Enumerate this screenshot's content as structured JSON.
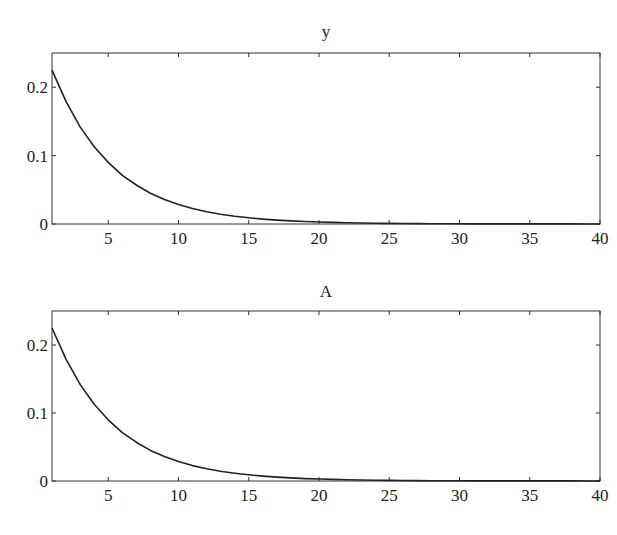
{
  "chart_data": [
    {
      "type": "line",
      "title": "y",
      "xlabel": "",
      "ylabel": "",
      "xlim": [
        1,
        40
      ],
      "ylim": [
        0,
        0.25
      ],
      "xticks": [
        5,
        10,
        15,
        20,
        25,
        30,
        35,
        40
      ],
      "yticks": [
        0,
        0.1,
        0.2
      ],
      "ytick_labels": [
        "0",
        "0.1",
        "0.2"
      ],
      "grid": false,
      "series": [
        {
          "name": "y",
          "x": [
            1,
            2,
            3,
            4,
            5,
            6,
            7,
            8,
            9,
            10,
            11,
            12,
            13,
            14,
            15,
            16,
            17,
            18,
            19,
            20,
            21,
            22,
            23,
            24,
            25,
            26,
            27,
            28,
            29,
            30,
            31,
            32,
            33,
            34,
            35,
            36,
            37,
            38,
            39,
            40
          ],
          "values": [
            0.225,
            0.179,
            0.142,
            0.113,
            0.09,
            0.071,
            0.057,
            0.045,
            0.036,
            0.0285,
            0.0227,
            0.018,
            0.0143,
            0.0114,
            0.0091,
            0.0072,
            0.0057,
            0.0046,
            0.0036,
            0.0029,
            0.0023,
            0.0018,
            0.0015,
            0.0012,
            0.0009,
            0.0007,
            0.0006,
            0.0005,
            0.0004,
            0.0003,
            0.0002,
            0.0002,
            0.0002,
            0.0001,
            0.0001,
            0.0001,
            0.0001,
            0.0001,
            0.0,
            0.0
          ]
        }
      ]
    },
    {
      "type": "line",
      "title": "A",
      "xlabel": "",
      "ylabel": "",
      "xlim": [
        1,
        40
      ],
      "ylim": [
        0,
        0.25
      ],
      "xticks": [
        5,
        10,
        15,
        20,
        25,
        30,
        35,
        40
      ],
      "yticks": [
        0,
        0.1,
        0.2
      ],
      "ytick_labels": [
        "0",
        "0.1",
        "0.2"
      ],
      "grid": false,
      "series": [
        {
          "name": "A",
          "x": [
            1,
            2,
            3,
            4,
            5,
            6,
            7,
            8,
            9,
            10,
            11,
            12,
            13,
            14,
            15,
            16,
            17,
            18,
            19,
            20,
            21,
            22,
            23,
            24,
            25,
            26,
            27,
            28,
            29,
            30,
            31,
            32,
            33,
            34,
            35,
            36,
            37,
            38,
            39,
            40
          ],
          "values": [
            0.225,
            0.179,
            0.142,
            0.113,
            0.09,
            0.071,
            0.057,
            0.045,
            0.036,
            0.0285,
            0.0227,
            0.018,
            0.0143,
            0.0114,
            0.0091,
            0.0072,
            0.0057,
            0.0046,
            0.0036,
            0.0029,
            0.0023,
            0.0018,
            0.0015,
            0.0012,
            0.0009,
            0.0007,
            0.0006,
            0.0005,
            0.0004,
            0.0003,
            0.0002,
            0.0002,
            0.0002,
            0.0001,
            0.0001,
            0.0001,
            0.0001,
            0.0001,
            0.0,
            0.0
          ]
        }
      ]
    }
  ],
  "colors": {
    "line": "#222222",
    "axes": "#333333",
    "background": "#ffffff"
  }
}
